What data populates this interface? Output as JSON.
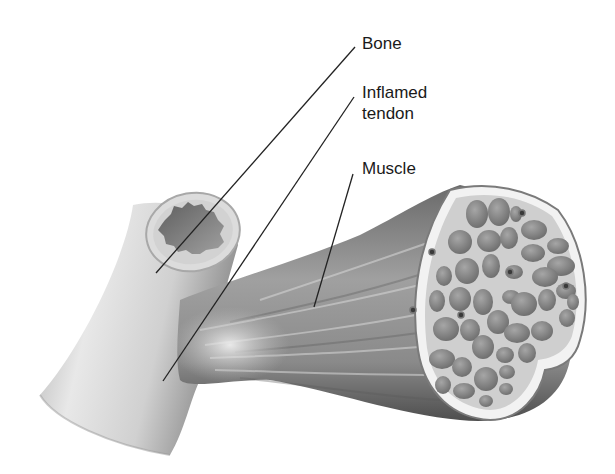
{
  "diagram": {
    "type": "anatomical-illustration",
    "labels": [
      {
        "id": "bone",
        "text": "Bone",
        "x": 362,
        "y": 35,
        "leader": {
          "x1": 355,
          "y1": 47,
          "x2": 156,
          "y2": 273
        }
      },
      {
        "id": "inflamed-tendon",
        "lines": [
          "Inflamed",
          "tendon"
        ],
        "x": 362,
        "y": 84,
        "leader": {
          "x1": 354,
          "y1": 97,
          "x2": 163,
          "y2": 381
        }
      },
      {
        "id": "muscle",
        "text": "Muscle",
        "x": 362,
        "y": 160,
        "leader": {
          "x1": 353,
          "y1": 174,
          "x2": 314,
          "y2": 307
        }
      }
    ],
    "colors": {
      "background": "#ffffff",
      "bone_light": "#e6e6e6",
      "bone_shadow": "#9a9a9a",
      "marrow": "#6e6e6e",
      "muscle_dark": "#5a5a5a",
      "muscle_light": "#c8c8c8",
      "fascicle": "#7d7d7d",
      "text": "#1a1a1a",
      "leader": "#222222"
    }
  }
}
